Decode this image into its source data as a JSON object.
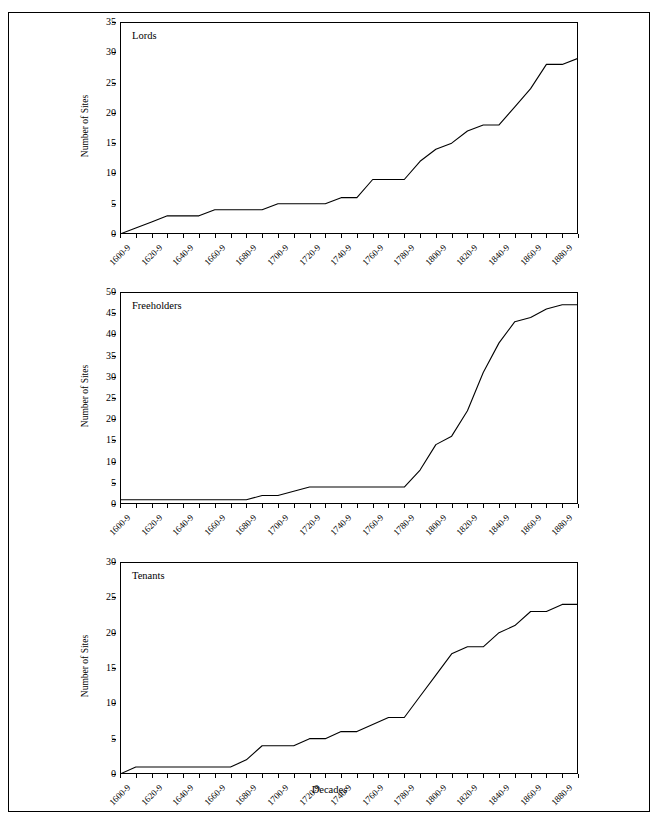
{
  "figure": {
    "xlabel": "Decades",
    "ylabel": "Number of Sites"
  },
  "chart_data": [
    {
      "type": "line",
      "title": "Lords",
      "xlabel": "",
      "ylabel": "Number of Sites",
      "ylim": [
        0,
        35
      ],
      "ytick_values": [
        0,
        5,
        10,
        15,
        20,
        25,
        30,
        35
      ],
      "grid": false,
      "legend": "none",
      "categories": [
        "1600-9",
        "1610-9",
        "1620-9",
        "1630-9",
        "1640-9",
        "1650-9",
        "1660-9",
        "1670-9",
        "1680-9",
        "1690-9",
        "1700-9",
        "1710-9",
        "1720-9",
        "1730-9",
        "1740-9",
        "1750-9",
        "1760-9",
        "1770-9",
        "1780-9",
        "1790-9",
        "1800-9",
        "1810-9",
        "1820-9",
        "1830-9",
        "1840-9",
        "1850-9",
        "1860-9",
        "1870-9",
        "1880-9",
        "1890-9"
      ],
      "xtick_labels": [
        "1600-9",
        "1620-9",
        "1640-9",
        "1660-9",
        "1680-9",
        "1700-9",
        "1720-9",
        "1740-9",
        "1760-9",
        "1780-9",
        "1800-9",
        "1820-9",
        "1840-9",
        "1860-9",
        "1880-9"
      ],
      "values": [
        0,
        1,
        2,
        3,
        3,
        3,
        4,
        4,
        4,
        4,
        5,
        5,
        5,
        5,
        6,
        6,
        9,
        9,
        9,
        12,
        14,
        15,
        17,
        18,
        18,
        21,
        24,
        28,
        28,
        29
      ]
    },
    {
      "type": "line",
      "title": "Freeholders",
      "xlabel": "",
      "ylabel": "Number of Sites",
      "ylim": [
        0,
        50
      ],
      "ytick_values": [
        0,
        5,
        10,
        15,
        20,
        25,
        30,
        35,
        40,
        45,
        50
      ],
      "grid": false,
      "legend": "none",
      "categories": [
        "1600-9",
        "1610-9",
        "1620-9",
        "1630-9",
        "1640-9",
        "1650-9",
        "1660-9",
        "1670-9",
        "1680-9",
        "1690-9",
        "1700-9",
        "1710-9",
        "1720-9",
        "1730-9",
        "1740-9",
        "1750-9",
        "1760-9",
        "1770-9",
        "1780-9",
        "1790-9",
        "1800-9",
        "1810-9",
        "1820-9",
        "1830-9",
        "1840-9",
        "1850-9",
        "1860-9",
        "1870-9",
        "1880-9",
        "1890-9"
      ],
      "xtick_labels": [
        "1600-9",
        "1620-9",
        "1640-9",
        "1660-9",
        "1680-9",
        "1700-9",
        "1720-9",
        "1740-9",
        "1760-9",
        "1780-9",
        "1800-9",
        "1820-9",
        "1840-9",
        "1860-9",
        "1880-9"
      ],
      "values": [
        1,
        1,
        1,
        1,
        1,
        1,
        1,
        1,
        1,
        2,
        2,
        3,
        4,
        4,
        4,
        4,
        4,
        4,
        4,
        8,
        14,
        16,
        22,
        31,
        38,
        43,
        44,
        46,
        47,
        47
      ]
    },
    {
      "type": "line",
      "title": "Tenants",
      "xlabel": "Decades",
      "ylabel": "Number of Sites",
      "ylim": [
        0,
        30
      ],
      "ytick_values": [
        0,
        5,
        10,
        15,
        20,
        25,
        30
      ],
      "grid": false,
      "legend": "none",
      "categories": [
        "1600-9",
        "1610-9",
        "1620-9",
        "1630-9",
        "1640-9",
        "1650-9",
        "1660-9",
        "1670-9",
        "1680-9",
        "1690-9",
        "1700-9",
        "1710-9",
        "1720-9",
        "1730-9",
        "1740-9",
        "1750-9",
        "1760-9",
        "1770-9",
        "1780-9",
        "1790-9",
        "1800-9",
        "1810-9",
        "1820-9",
        "1830-9",
        "1840-9",
        "1850-9",
        "1860-9",
        "1870-9",
        "1880-9",
        "1890-9"
      ],
      "xtick_labels": [
        "1600-9",
        "1620-9",
        "1640-9",
        "1660-9",
        "1680-9",
        "1700-9",
        "1720-9",
        "1740-9",
        "1760-9",
        "1780-9",
        "1800-9",
        "1820-9",
        "1840-9",
        "1860-9",
        "1880-9"
      ],
      "values": [
        0,
        1,
        1,
        1,
        1,
        1,
        1,
        1,
        2,
        4,
        4,
        4,
        5,
        5,
        6,
        6,
        7,
        8,
        8,
        11,
        14,
        17,
        18,
        18,
        20,
        21,
        23,
        23,
        24,
        24
      ]
    }
  ]
}
